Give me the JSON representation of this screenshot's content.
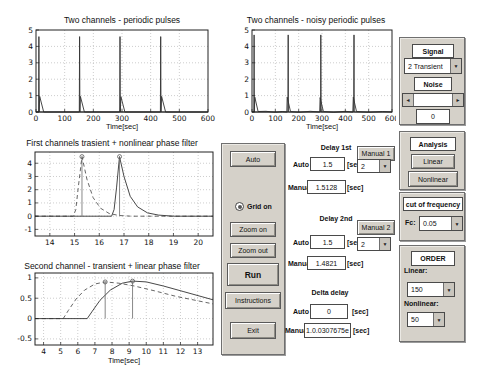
{
  "chart_data": [
    {
      "type": "line",
      "title": "Two channels - periodic pulses",
      "xlabel": "Time[sec]",
      "xlim": [
        0,
        600
      ],
      "ylim": [
        0,
        5
      ],
      "xticks": [
        0,
        100,
        200,
        300,
        400,
        500,
        600
      ],
      "yticks": [
        0,
        1,
        2,
        3,
        4,
        5
      ],
      "grid": true,
      "axes": {
        "x": 33,
        "y": 27,
        "w": 172,
        "h": 82
      },
      "series": [
        {
          "name": "channel-1-spikes",
          "color": "#333333",
          "dash": false,
          "points": [
            [
              0,
              0
            ],
            [
              9,
              0
            ],
            [
              10,
              4.6
            ],
            [
              11,
              0
            ],
            [
              151,
              0
            ],
            [
              152,
              4.6
            ],
            [
              153,
              0
            ],
            [
              292,
              0
            ],
            [
              293,
              4.6
            ],
            [
              294,
              0
            ],
            [
              434,
              0
            ],
            [
              435,
              4.6
            ],
            [
              436,
              0
            ],
            [
              600,
              0
            ]
          ]
        },
        {
          "name": "channel-2-pulses",
          "color": "#333333",
          "dash": false,
          "points": [
            [
              0,
              0
            ],
            [
              11,
              0
            ],
            [
              13,
              0.95
            ],
            [
              27,
              0
            ],
            [
              153,
              0
            ],
            [
              155,
              0.95
            ],
            [
              169,
              0
            ],
            [
              294,
              0
            ],
            [
              296,
              0.93
            ],
            [
              310,
              0
            ],
            [
              436,
              0
            ],
            [
              438,
              0.95
            ],
            [
              452,
              0
            ],
            [
              600,
              0
            ]
          ]
        }
      ],
      "stems": []
    },
    {
      "type": "line",
      "title": "Two channels - noisy periodic pulses",
      "xlabel": "Time[sec]",
      "xlim": [
        0,
        600
      ],
      "ylim": [
        0,
        5
      ],
      "xticks": [
        0,
        100,
        200,
        300,
        400,
        500,
        600
      ],
      "yticks": [
        0,
        1,
        2,
        3,
        4,
        5
      ],
      "grid": true,
      "axes": {
        "x": 16,
        "y": 27,
        "w": 140,
        "h": 82
      },
      "series": [
        {
          "name": "channel-1-spikes",
          "color": "#333333",
          "dash": false,
          "points": [
            [
              0,
              0
            ],
            [
              8,
              0
            ],
            [
              9,
              4.7
            ],
            [
              10,
              0
            ],
            [
              154,
              0
            ],
            [
              155,
              4.7
            ],
            [
              156,
              0
            ],
            [
              294,
              0
            ],
            [
              295,
              4.7
            ],
            [
              296,
              0
            ],
            [
              436,
              0
            ],
            [
              437,
              4.7
            ],
            [
              438,
              0
            ],
            [
              600,
              0
            ]
          ]
        },
        {
          "name": "channel-2-noisy-pulses",
          "color": "#333333",
          "dash": false,
          "points": [
            [
              0,
              0
            ],
            [
              10,
              0
            ],
            [
              12,
              0.9
            ],
            [
              26,
              0.03
            ],
            [
              60,
              0.04
            ],
            [
              100,
              -0.02
            ],
            [
              130,
              0.03
            ],
            [
              149,
              0
            ],
            [
              151,
              0.9
            ],
            [
              165,
              0.03
            ],
            [
              200,
              -0.02
            ],
            [
              250,
              0.04
            ],
            [
              290,
              0
            ],
            [
              292,
              0.88
            ],
            [
              306,
              0.03
            ],
            [
              350,
              -0.02
            ],
            [
              400,
              0.04
            ],
            [
              432,
              0
            ],
            [
              434,
              0.9
            ],
            [
              448,
              0.03
            ],
            [
              500,
              -0.02
            ],
            [
              560,
              0.03
            ],
            [
              600,
              0
            ]
          ]
        }
      ],
      "stems": []
    },
    {
      "type": "line",
      "title": "First channels trasient + nonlinear phase filter",
      "xlabel": "",
      "xlim": [
        13.4,
        20.6
      ],
      "ylim": [
        -1.5,
        4.85
      ],
      "xticks": [
        14,
        15,
        16,
        17,
        18,
        19,
        20
      ],
      "yticks": [
        -1,
        0,
        1,
        2,
        3,
        4
      ],
      "grid": true,
      "axes": {
        "x": 32,
        "y": 16,
        "w": 178,
        "h": 84
      },
      "series": [
        {
          "name": "nonlinear-filter-output-dashed",
          "color": "#555555",
          "dash": true,
          "points": [
            [
              13.4,
              0
            ],
            [
              14.95,
              0
            ],
            [
              15.05,
              0.5
            ],
            [
              15.15,
              2.2
            ],
            [
              15.3,
              4.5
            ],
            [
              15.5,
              2.8
            ],
            [
              15.75,
              1.4
            ],
            [
              16.05,
              0.6
            ],
            [
              16.4,
              0.2
            ],
            [
              16.8,
              0.05
            ],
            [
              17.3,
              0
            ],
            [
              20.6,
              0
            ]
          ]
        },
        {
          "name": "transient-solid",
          "color": "#333333",
          "dash": false,
          "points": [
            [
              13.4,
              0
            ],
            [
              16.5,
              0
            ],
            [
              16.6,
              0.5
            ],
            [
              16.7,
              2.2
            ],
            [
              16.82,
              4.5
            ],
            [
              17.0,
              3.0
            ],
            [
              17.25,
              1.5
            ],
            [
              17.55,
              0.7
            ],
            [
              17.95,
              0.25
            ],
            [
              18.4,
              0.08
            ],
            [
              19.0,
              0
            ],
            [
              20.6,
              0
            ]
          ]
        }
      ],
      "stems": [
        {
          "x": 15.3,
          "y": 4.5
        },
        {
          "x": 16.82,
          "y": 4.5
        }
      ]
    },
    {
      "type": "line",
      "title": "Second channel - transient + linear phase filter",
      "xlabel": "Time[sec]",
      "xlim": [
        3.5,
        13.9
      ],
      "ylim": [
        -0.65,
        1.12
      ],
      "xticks": [
        4,
        5,
        6,
        7,
        8,
        9,
        10,
        11,
        12,
        13
      ],
      "yticks": [
        -0.5,
        0,
        0.5,
        1
      ],
      "grid": true,
      "axes": {
        "x": 32,
        "y": 13,
        "w": 178,
        "h": 72
      },
      "series": [
        {
          "name": "linear-filter-output-dashed",
          "color": "#555555",
          "dash": true,
          "points": [
            [
              3.5,
              0
            ],
            [
              5.15,
              0
            ],
            [
              5.45,
              0.2
            ],
            [
              5.9,
              0.48
            ],
            [
              6.4,
              0.7
            ],
            [
              7.0,
              0.85
            ],
            [
              7.6,
              0.9
            ],
            [
              8.4,
              0.87
            ],
            [
              9.3,
              0.8
            ],
            [
              10.5,
              0.68
            ],
            [
              11.7,
              0.55
            ],
            [
              13.9,
              0.36
            ]
          ]
        },
        {
          "name": "transient-solid",
          "color": "#333333",
          "dash": false,
          "points": [
            [
              3.5,
              0
            ],
            [
              6.55,
              0
            ],
            [
              6.85,
              0.18
            ],
            [
              7.3,
              0.45
            ],
            [
              7.9,
              0.7
            ],
            [
              8.6,
              0.87
            ],
            [
              9.2,
              0.92
            ],
            [
              10.0,
              0.9
            ],
            [
              11.0,
              0.8
            ],
            [
              12.2,
              0.66
            ],
            [
              13.9,
              0.46
            ]
          ]
        }
      ],
      "stems": [
        {
          "x": 7.6,
          "y": 0.9
        },
        {
          "x": 9.2,
          "y": 0.92
        }
      ]
    }
  ],
  "panel_buttons": {
    "auto": "Auto",
    "grid_on": "Grid on",
    "zoom_on": "Zoom on",
    "zoom_out": "Zoom out",
    "run": "Run",
    "instructions": "Instructions",
    "exit": "Exit"
  },
  "delay1": {
    "title": "Delay 1st",
    "manual_button": "Manual 1",
    "auto_label": "Auto",
    "auto_value": "1.5",
    "manual_label": "Manual",
    "manual_value": "1.5128",
    "sec": "[sec]",
    "dropdown_value": "2"
  },
  "delay2": {
    "title": "Delay 2nd",
    "manual_button": "Manual 2",
    "auto_label": "Auto",
    "auto_value": "1.5",
    "manual_label": "Manual",
    "manual_value": "1.4821",
    "sec": "[sec]",
    "dropdown_value": "2"
  },
  "delta": {
    "title": "Delta delay",
    "auto_label": "Auto",
    "auto_value": "0",
    "manual_label": "Manual",
    "manual_value": "1.0.0307675e",
    "sec": "[sec]"
  },
  "signal_panel": {
    "title": "Signal",
    "signal_select": "2 Transient",
    "noise_title": "Noise",
    "noise_value": "0"
  },
  "analysis_panel": {
    "title": "Analysis",
    "linear": "Linear",
    "nonlinear": "Nonlinear"
  },
  "cutoff_panel": {
    "title": "cut of frequency",
    "fc_label": "Fc:",
    "fc_value": "0.05"
  },
  "order_panel": {
    "title": "ORDER",
    "linear_label": "Linear:",
    "linear_value": "150",
    "nonlinear_label": "Nonlinear:",
    "nonlinear_value": "50"
  }
}
